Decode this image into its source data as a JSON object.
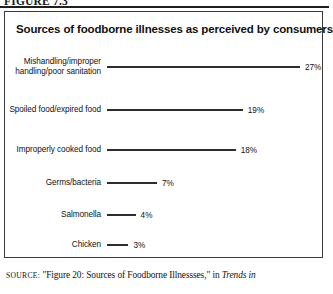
{
  "figure": {
    "label": "FIGURE 7.3"
  },
  "chart_data": {
    "type": "bar",
    "orientation": "horizontal",
    "title": "Sources of foodborne illnesses as perceived by consumers",
    "xlabel": "",
    "ylabel": "",
    "grid": false,
    "legend": false,
    "xlim": [
      0,
      27
    ],
    "categories": [
      "Mishandling/improper handling/poor sanitation",
      "Spoiled food/expired food",
      "Improperly cooked food",
      "Germs/bacteria",
      "Salmonella",
      "Chicken"
    ],
    "values": [
      27,
      19,
      18,
      7,
      4,
      3
    ],
    "value_labels": [
      "27%",
      "19%",
      "18%",
      "7%",
      "4%",
      "3%"
    ],
    "bar_color": "#4b4b4b",
    "bar_border_color": "#2d2d2d"
  },
  "source": {
    "prefix": "SOURCE:",
    "text": " \"Figure 20: Sources of Foodborne Illnessses,\" in ",
    "italic": "Trends in"
  }
}
